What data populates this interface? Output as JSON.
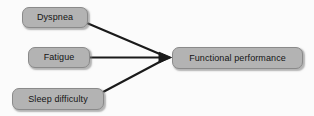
{
  "diagram": {
    "type": "path-diagram",
    "background_color": "#fbfbfb",
    "node_fill_color": "#b3b3b3",
    "node_border_color": "#8a8a8a",
    "node_text_color": "#141414",
    "edge_color": "#1a1a1a",
    "nodes": [
      {
        "id": "dyspnea",
        "label": "Dyspnea"
      },
      {
        "id": "fatigue",
        "label": "Fatigue"
      },
      {
        "id": "sleep_difficulty",
        "label": "Sleep difficulty"
      },
      {
        "id": "functional_performance",
        "label": "Functional performance"
      }
    ],
    "edges": [
      {
        "from": "dyspnea",
        "to": "functional_performance",
        "arrow": true
      },
      {
        "from": "fatigue",
        "to": "functional_performance",
        "arrow": true
      },
      {
        "from": "sleep_difficulty",
        "to": "functional_performance",
        "arrow": true
      }
    ]
  }
}
